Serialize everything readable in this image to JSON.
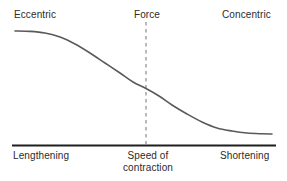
{
  "figure": {
    "width": 287,
    "height": 181,
    "background": "#ffffff"
  },
  "labels": {
    "top_left": "Eccentric",
    "top_center": "Force",
    "top_right": "Concentric",
    "bottom_left": "Lengthening",
    "bottom_center_line1": "Speed of",
    "bottom_center_line2": "contraction",
    "bottom_right": "Shortening"
  },
  "colors": {
    "curve": "#5a5a5a",
    "axis": "#1f1f1f",
    "dashed_line": "#8c8c8c",
    "text": "#2b2b2b",
    "background": "#ffffff"
  },
  "chart_data": {
    "type": "line",
    "title": "",
    "subtitle": "",
    "xlabel": "Speed of contraction",
    "ylabel": "Force",
    "grid": false,
    "legend": null,
    "annotations": [
      {
        "text": "Eccentric",
        "position": "top-left"
      },
      {
        "text": "Force",
        "position": "top-center"
      },
      {
        "text": "Concentric",
        "position": "top-right"
      },
      {
        "text": "Lengthening",
        "position": "bottom-left"
      },
      {
        "text": "Speed of contraction",
        "position": "bottom-center"
      },
      {
        "text": "Shortening",
        "position": "bottom-right"
      }
    ],
    "axis_line_y_px": 145,
    "axis_line_x_range_px": [
      12,
      276
    ],
    "reference_line": {
      "orientation": "vertical",
      "x_px": 146,
      "y_range_px": [
        22,
        145
      ],
      "style": "dashed",
      "label": "Force"
    },
    "xlim": [
      15,
      272
    ],
    "ylim": [
      31,
      145
    ],
    "series": [
      {
        "name": "Force-velocity relationship",
        "style": "sigmoid",
        "points_px": [
          [
            15,
            31
          ],
          [
            30,
            31.4
          ],
          [
            45,
            33
          ],
          [
            60,
            37
          ],
          [
            75,
            44
          ],
          [
            90,
            53
          ],
          [
            105,
            63
          ],
          [
            120,
            73
          ],
          [
            133,
            82
          ],
          [
            146,
            88.5
          ],
          [
            159,
            96
          ],
          [
            172,
            105
          ],
          [
            187,
            114
          ],
          [
            202,
            122
          ],
          [
            217,
            128
          ],
          [
            232,
            131
          ],
          [
            247,
            133
          ],
          [
            262,
            133.8
          ],
          [
            272,
            134
          ]
        ]
      }
    ]
  }
}
